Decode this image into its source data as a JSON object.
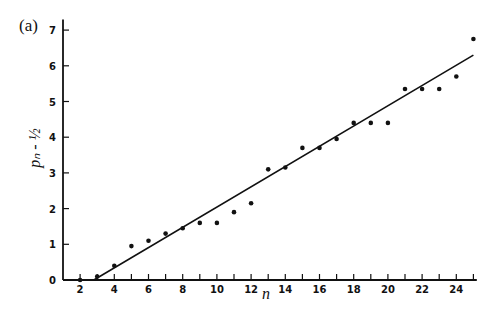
{
  "panel_label": "(a)",
  "chart_data": {
    "type": "scatter",
    "title": "",
    "xlabel": "n",
    "ylabel": "p_n - ½",
    "xlim": [
      1,
      25.2
    ],
    "ylim": [
      0,
      7.3
    ],
    "x_ticks": [
      2,
      4,
      6,
      8,
      10,
      12,
      14,
      16,
      18,
      20,
      22,
      24
    ],
    "x_minor_ticks": [
      3,
      5,
      7,
      9,
      11,
      13,
      15,
      17,
      19,
      21,
      23,
      25
    ],
    "y_ticks": [
      0,
      1,
      2,
      3,
      4,
      5,
      6,
      7
    ],
    "grid": false,
    "legend": null,
    "series": [
      {
        "name": "data points",
        "kind": "scatter",
        "x": [
          2,
          3,
          4,
          5,
          6,
          7,
          8,
          9,
          10,
          11,
          12,
          13,
          14,
          15,
          16,
          17,
          18,
          19,
          20,
          21,
          22,
          23,
          24,
          25
        ],
        "y": [
          0.0,
          0.1,
          0.4,
          0.95,
          1.1,
          1.3,
          1.45,
          1.6,
          1.6,
          1.9,
          2.15,
          3.1,
          3.15,
          3.7,
          3.7,
          3.95,
          4.4,
          4.4,
          4.4,
          5.35,
          5.35,
          5.35,
          5.7,
          6.75
        ]
      },
      {
        "name": "fitted line",
        "kind": "line",
        "x": [
          2.8,
          25.0
        ],
        "y": [
          0.0,
          6.3
        ]
      }
    ]
  }
}
